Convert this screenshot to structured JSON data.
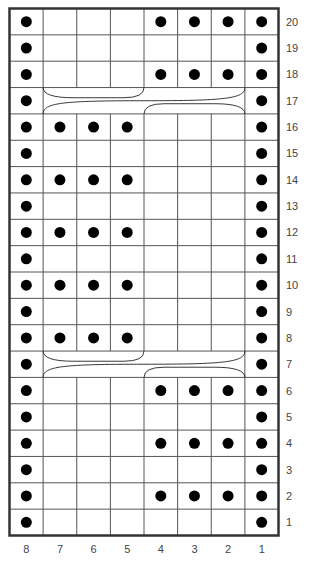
{
  "chart": {
    "title": "",
    "columns": 8,
    "rows": 20,
    "column_labels": [
      "8",
      "7",
      "6",
      "5",
      "4",
      "3",
      "2",
      "1"
    ],
    "row_labels": [
      "20",
      "19",
      "18",
      "17",
      "16",
      "15",
      "14",
      "13",
      "12",
      "11",
      "10",
      "9",
      "8",
      "7",
      "6",
      "5",
      "4",
      "3",
      "2",
      "1"
    ],
    "legend_symbols": {
      "dot": "purl",
      "cable": "cable-cross"
    },
    "grid": [
      [
        1,
        0,
        0,
        0,
        1,
        1,
        1,
        1
      ],
      [
        1,
        0,
        0,
        0,
        0,
        0,
        0,
        1
      ],
      [
        1,
        0,
        0,
        0,
        1,
        1,
        1,
        1
      ],
      [
        1,
        "c",
        "c",
        "c",
        "c",
        "c",
        "c",
        1
      ],
      [
        1,
        1,
        1,
        1,
        0,
        0,
        0,
        1
      ],
      [
        1,
        0,
        0,
        0,
        0,
        0,
        0,
        1
      ],
      [
        1,
        1,
        1,
        1,
        0,
        0,
        0,
        1
      ],
      [
        1,
        0,
        0,
        0,
        0,
        0,
        0,
        1
      ],
      [
        1,
        1,
        1,
        1,
        0,
        0,
        0,
        1
      ],
      [
        1,
        0,
        0,
        0,
        0,
        0,
        0,
        1
      ],
      [
        1,
        1,
        1,
        1,
        0,
        0,
        0,
        1
      ],
      [
        1,
        0,
        0,
        0,
        0,
        0,
        0,
        1
      ],
      [
        1,
        1,
        1,
        1,
        0,
        0,
        0,
        1
      ],
      [
        1,
        "c",
        "c",
        "c",
        "c",
        "c",
        "c",
        1
      ],
      [
        1,
        0,
        0,
        0,
        1,
        1,
        1,
        1
      ],
      [
        1,
        0,
        0,
        0,
        0,
        0,
        0,
        1
      ],
      [
        1,
        0,
        0,
        0,
        1,
        1,
        1,
        1
      ],
      [
        1,
        0,
        0,
        0,
        0,
        0,
        0,
        1
      ],
      [
        1,
        0,
        0,
        0,
        1,
        1,
        1,
        1
      ],
      [
        1,
        0,
        0,
        0,
        0,
        0,
        0,
        1
      ]
    ],
    "cable_rows": [
      "17",
      "7"
    ],
    "colors": {
      "grid_line": "#555555",
      "border": "#333333",
      "dot": "#000000",
      "background": "#ffffff"
    }
  }
}
